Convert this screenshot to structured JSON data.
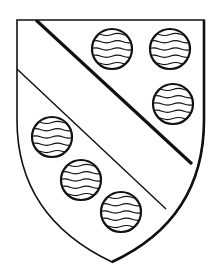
{
  "figure": {
    "colors": {
      "ink": "#111111",
      "field": "#ffffff"
    },
    "shield": {
      "outline": "M17,20 L204,20 L204,120 C204,190 170,235 112,262 C55,235 17,190 17,120 Z"
    },
    "bend": {
      "upper_line": {
        "x1": 36,
        "y1": 20,
        "x2": 192,
        "y2": 164
      },
      "lower_line": {
        "x1": 17,
        "y1": 69,
        "x2": 166,
        "y2": 209
      }
    },
    "roundels": [
      {
        "cx": 112,
        "cy": 49,
        "r": 20
      },
      {
        "cx": 170,
        "cy": 49,
        "r": 20
      },
      {
        "cx": 173,
        "cy": 104,
        "r": 20
      },
      {
        "cx": 52,
        "cy": 137,
        "r": 20
      },
      {
        "cx": 81,
        "cy": 180,
        "r": 20
      },
      {
        "cx": 121,
        "cy": 212,
        "r": 20
      }
    ],
    "wavy_lines_per_roundel": 5
  }
}
